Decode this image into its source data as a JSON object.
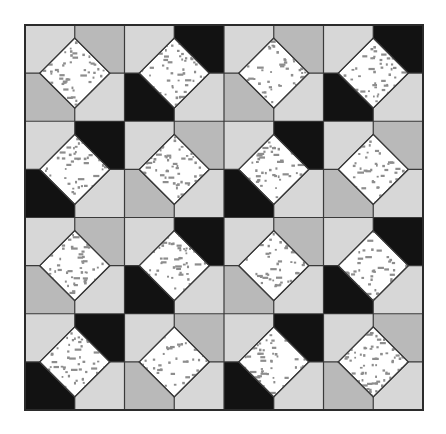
{
  "figure": {
    "type": "tiling-pattern",
    "canvas": {
      "width": 446,
      "height": 434,
      "background": "#ffffff"
    }
  },
  "palette": {
    "light_gray": "#d7d7d7",
    "medium_gray": "#b9b9b9",
    "black": "#121212",
    "diamond_fill": "#ffffff",
    "diamond_speckle": "#8d8d8d",
    "grid_line": "#3a3a3a",
    "border": "#2b2b2b",
    "page_background": "#ffffff"
  },
  "grid": {
    "columns": 8,
    "rows": 8,
    "origin_x": 25,
    "origin_y": 25,
    "cell_width": 49.75,
    "cell_height": 48.125,
    "line_width": 1.2,
    "border_width": 2,
    "legend_keys": [
      "light_gray",
      "medium_gray",
      "black"
    ],
    "cells": [
      [
        "light_gray",
        "medium_gray",
        "light_gray",
        "black",
        "light_gray",
        "medium_gray",
        "light_gray",
        "black"
      ],
      [
        "medium_gray",
        "light_gray",
        "black",
        "light_gray",
        "medium_gray",
        "light_gray",
        "black",
        "light_gray"
      ],
      [
        "light_gray",
        "black",
        "light_gray",
        "medium_gray",
        "light_gray",
        "black",
        "light_gray",
        "medium_gray"
      ],
      [
        "black",
        "light_gray",
        "medium_gray",
        "light_gray",
        "black",
        "light_gray",
        "medium_gray",
        "light_gray"
      ],
      [
        "light_gray",
        "medium_gray",
        "light_gray",
        "black",
        "light_gray",
        "medium_gray",
        "light_gray",
        "black"
      ],
      [
        "medium_gray",
        "light_gray",
        "black",
        "light_gray",
        "medium_gray",
        "light_gray",
        "black",
        "light_gray"
      ],
      [
        "light_gray",
        "black",
        "light_gray",
        "medium_gray",
        "light_gray",
        "black",
        "light_gray",
        "medium_gray"
      ],
      [
        "black",
        "light_gray",
        "medium_gray",
        "light_gray",
        "black",
        "light_gray",
        "medium_gray",
        "light_gray"
      ]
    ]
  },
  "diamonds": {
    "count": 16,
    "half_diagonal": 35,
    "stroke_width": 1.2,
    "speckle_density": "high",
    "vertices": [
      {
        "col": 1,
        "row": 1
      },
      {
        "col": 3,
        "row": 1
      },
      {
        "col": 5,
        "row": 1
      },
      {
        "col": 7,
        "row": 1
      },
      {
        "col": 1,
        "row": 3
      },
      {
        "col": 3,
        "row": 3
      },
      {
        "col": 5,
        "row": 3
      },
      {
        "col": 7,
        "row": 3
      },
      {
        "col": 1,
        "row": 5
      },
      {
        "col": 3,
        "row": 5
      },
      {
        "col": 5,
        "row": 5
      },
      {
        "col": 7,
        "row": 5
      },
      {
        "col": 1,
        "row": 7
      },
      {
        "col": 3,
        "row": 7
      },
      {
        "col": 5,
        "row": 7
      },
      {
        "col": 7,
        "row": 7
      }
    ]
  }
}
